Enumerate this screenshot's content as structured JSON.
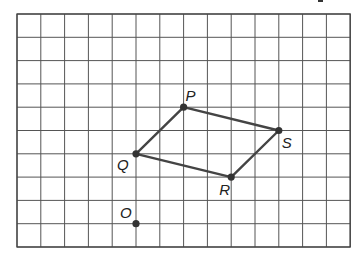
{
  "diagram": {
    "type": "coordinate-grid",
    "grid": {
      "columns": 14,
      "rows": 10,
      "origin_px": [
        17,
        14
      ],
      "cell_w": 23.8,
      "cell_h": 23.3,
      "line_color": "#555555",
      "border_color": "#444444"
    },
    "points": [
      {
        "label": "P",
        "col": 7,
        "row": 4,
        "label_dx": 2,
        "label_dy": -6
      },
      {
        "label": "Q",
        "col": 5,
        "row": 6,
        "label_dx": -19,
        "label_dy": 16
      },
      {
        "label": "R",
        "col": 9,
        "row": 7,
        "label_dx": -12,
        "label_dy": 18
      },
      {
        "label": "S",
        "col": 11,
        "row": 5,
        "label_dx": 3,
        "label_dy": 17
      },
      {
        "label": "O",
        "col": 5,
        "row": 9,
        "label_dx": -16,
        "label_dy": -6
      }
    ],
    "polygon": {
      "vertices": [
        "P",
        "S",
        "R",
        "Q"
      ],
      "stroke": "#444444"
    },
    "point_color": "#333333"
  }
}
